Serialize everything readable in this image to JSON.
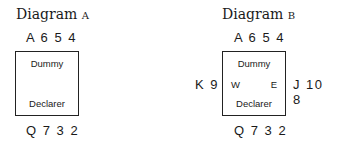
{
  "diagram_a": {
    "title_prefix": "Diagram",
    "title_letter": "A",
    "north": "A 6 5 4",
    "box_top": "Dummy",
    "box_bottom": "Declarer",
    "south": "Q 7 3 2"
  },
  "diagram_b": {
    "title_prefix": "Diagram",
    "title_letter": "B",
    "north": "A 6 5 4",
    "west_hand": "K 9",
    "east_hand": "J 10 8",
    "box_top": "Dummy",
    "box_west": "W",
    "box_east": "E",
    "box_bottom": "Declarer",
    "south": "Q 7 3 2"
  }
}
